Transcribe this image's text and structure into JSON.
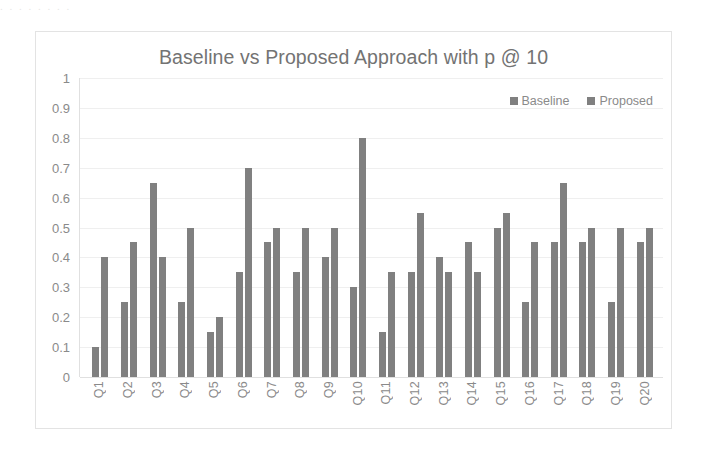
{
  "scan_artifact": {
    "top_text": "   .  .      .            .          .        .          .     .   "
  },
  "chart": {
    "title": "Baseline vs Proposed Approach with p @ 10",
    "legend": [
      {
        "label": "Baseline",
        "color": "#808080"
      },
      {
        "label": "Proposed",
        "color": "#808080"
      }
    ],
    "y_ticks": [
      "1",
      "0.9",
      "0.8",
      "0.7",
      "0.6",
      "0.5",
      "0.4",
      "0.3",
      "0.2",
      "0.1",
      "0"
    ]
  },
  "chart_data": {
    "type": "bar",
    "title": "Baseline vs Proposed Approach with p @ 10",
    "xlabel": "",
    "ylabel": "",
    "ylim": [
      0,
      1
    ],
    "ytick_step": 0.1,
    "grid": true,
    "legend_position": "top-right",
    "categories": [
      "Q1",
      "Q2",
      "Q3",
      "Q4",
      "Q5",
      "Q6",
      "Q7",
      "Q8",
      "Q9",
      "Q10",
      "Q11",
      "Q12",
      "Q13",
      "Q14",
      "Q15",
      "Q16",
      "Q17",
      "Q18",
      "Q19",
      "Q20"
    ],
    "series": [
      {
        "name": "Baseline",
        "color": "#808080",
        "values": [
          0.1,
          0.25,
          0.65,
          0.25,
          0.15,
          0.35,
          0.45,
          0.35,
          0.4,
          0.3,
          0.15,
          0.35,
          0.4,
          0.45,
          0.5,
          0.25,
          0.45,
          0.45,
          0.25,
          0.45
        ]
      },
      {
        "name": "Proposed",
        "color": "#808080",
        "values": [
          0.4,
          0.45,
          0.4,
          0.5,
          0.2,
          0.7,
          0.5,
          0.5,
          0.5,
          0.8,
          0.35,
          0.55,
          0.35,
          0.35,
          0.55,
          0.45,
          0.65,
          0.5,
          0.5,
          0.5
        ]
      }
    ]
  }
}
